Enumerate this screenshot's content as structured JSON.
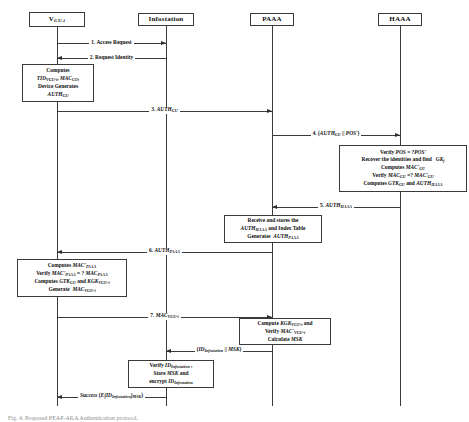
{
  "diagram": {
    "type": "sequence-diagram",
    "caption": "Fig. 4.   Proposed PEAP-AKA Authentication protocol.",
    "actors": [
      {
        "id": "vgu",
        "label": "V",
        "sub": "GU-i",
        "x": 57,
        "box_w": 56,
        "box_h": 15
      },
      {
        "id": "info",
        "label": "Infostation",
        "sub": "",
        "x": 166,
        "box_w": 56,
        "box_h": 13
      },
      {
        "id": "paaa",
        "label": "PAAA",
        "sub": "",
        "x": 272,
        "box_w": 44,
        "box_h": 13
      },
      {
        "id": "haaa",
        "label": "HAAA",
        "sub": "",
        "x": 400,
        "box_w": 44,
        "box_h": 13
      }
    ],
    "messages": [
      {
        "id": "m1",
        "number": "1.",
        "text": "Access Request",
        "from": "vgu",
        "to": "info",
        "dir": "right",
        "y": 43
      },
      {
        "id": "m2",
        "number": "2.",
        "text": "Request Identity",
        "from": "info",
        "to": "vgu",
        "dir": "left",
        "y": 58
      },
      {
        "id": "m3",
        "number": "3.",
        "text": "AUTH_GU",
        "from": "vgu",
        "to": "paaa",
        "dir": "right",
        "y": 110
      },
      {
        "id": "m4",
        "number": "4.",
        "text": "(AUTH_GU || POS')",
        "from": "paaa",
        "to": "haaa",
        "dir": "right",
        "y": 134
      },
      {
        "id": "m5",
        "number": "5.",
        "text": "AUTH_HAAA",
        "from": "haaa",
        "to": "paaa",
        "dir": "left",
        "y": 206
      },
      {
        "id": "m6",
        "number": "6.",
        "text": "AUTH_PAAA",
        "from": "paaa",
        "to": "vgu",
        "dir": "left",
        "y": 251
      },
      {
        "id": "m7",
        "number": "7.",
        "text": "MAC_VGU-i",
        "from": "vgu",
        "to": "paaa",
        "dir": "right",
        "y": 316
      },
      {
        "id": "m8",
        "number": "",
        "text": "(ID_Infostation || MSK)",
        "from": "paaa",
        "to": "info",
        "dir": "left",
        "y": 350
      },
      {
        "id": "m9",
        "number": "",
        "text": "Success (E{ID_Infostation}_MSK)",
        "from": "info",
        "to": "vgu",
        "dir": "left",
        "y": 396
      }
    ],
    "notes": [
      {
        "id": "note-vgu-1",
        "owner": "vgu",
        "lines": [
          "Computes",
          "TID_VGU-i, MAC_GU,",
          "Device Generates",
          "AUTH_GU"
        ],
        "x": 22,
        "y": 64,
        "w": 72,
        "h": 38
      },
      {
        "id": "note-haaa-1",
        "owner": "haaa",
        "lines": [
          "Verify POS = ?POS'",
          "Recover the identities and find   GK_j",
          "Computes MAC'_GU",
          "Verify MAC_GU =? MAC'_GU",
          "Computes GTK_GU and AUTH_HAAA"
        ],
        "x": 339,
        "y": 145,
        "w": 128,
        "h": 47
      },
      {
        "id": "note-paaa-1",
        "owner": "paaa",
        "lines": [
          "Receive and stores the",
          "AUTH_HAAA and Index Table",
          "Generates AUTH_PAAA"
        ],
        "x": 224,
        "y": 215,
        "w": 98,
        "h": 28
      },
      {
        "id": "note-vgu-2",
        "owner": "vgu",
        "lines": [
          "Computes MAC'_PAAA",
          "Verify MAC'_PAAA = ? MAC_PAAA",
          "Computes GTK_GU and KGK_VGU-i",
          "Generate MAC_VGU-i"
        ],
        "x": 17,
        "y": 259,
        "w": 110,
        "h": 38
      },
      {
        "id": "note-paaa-2",
        "owner": "paaa",
        "lines": [
          "Compute KGK_VGU-i and",
          "Verify MAC'_VGU-i",
          "Calculate MSK"
        ],
        "x": 239,
        "y": 318,
        "w": 92,
        "h": 27
      },
      {
        "id": "note-info-1",
        "owner": "info",
        "lines": [
          "Verify ID_Infostation ,",
          "Store MSK and",
          "encrypt ID_Infostation"
        ],
        "x": 128,
        "y": 360,
        "w": 86,
        "h": 28
      }
    ],
    "colors": {
      "line": "#3b3b3b",
      "box_border": "#3a3a3a",
      "text": "#0d0d0d",
      "background": "#ffffff",
      "caption": "#8e8e8e"
    }
  }
}
